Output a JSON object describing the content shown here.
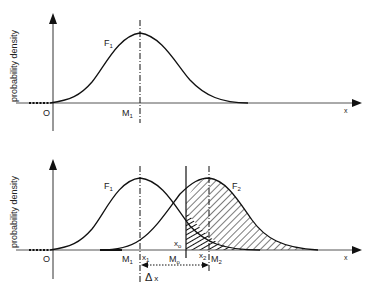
{
  "top_panel": {
    "ylabel": "probability density",
    "xlabel": "x",
    "origin_label": "O",
    "curve_label": "F",
    "curve_sub": "1",
    "mean_label": "M",
    "mean_sub": "1"
  },
  "bottom_panel": {
    "ylabel": "probability density",
    "xlabel": "x",
    "origin_label": "O",
    "curve1_label": "F",
    "curve1_sub": "1",
    "curve2_label": "F",
    "curve2_sub": "2",
    "m1_label": "M",
    "m1_sub": "1",
    "x1_label": "x",
    "x1_sub": "1",
    "m0_label": "M",
    "m0_sub": "o",
    "x0_label": "x",
    "x0_sub": "o",
    "x2_label": "x",
    "x2_sub": "2",
    "m2_label": "M",
    "m2_sub": "2",
    "delta_label": "Δ",
    "delta_var": "x"
  }
}
